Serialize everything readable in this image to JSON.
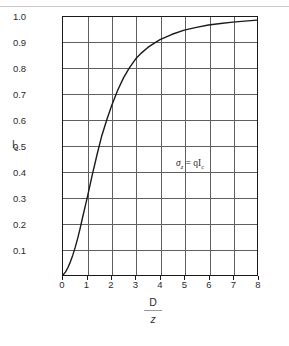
{
  "chart_data": {
    "type": "line",
    "title": "",
    "subtitle": "",
    "xlabel_numerator": "D",
    "xlabel_denominator": "z",
    "ylabel": "I",
    "ylabel_sub": "c",
    "xlim": [
      0,
      8
    ],
    "ylim": [
      0,
      1.0
    ],
    "grid": true,
    "legend_position": "none",
    "x_ticks": [
      "0",
      "1",
      "2",
      "3",
      "4",
      "5",
      "6",
      "7",
      "8"
    ],
    "y_ticks": [
      "0.1",
      "0.2",
      "0.3",
      "0.4",
      "0.5",
      "0.6",
      "0.7",
      "0.8",
      "0.9",
      "1.0"
    ],
    "annotations": [
      {
        "sigma": "σ",
        "sigma_sub": "z",
        "equals": "=",
        "rhs": "qI",
        "rhs_sub": "c",
        "full_text": "σz = qIc"
      }
    ],
    "series": [
      {
        "name": "Ic",
        "x": [
          0,
          0.1,
          0.2,
          0.3,
          0.4,
          0.5,
          0.6,
          0.7,
          0.8,
          0.9,
          1.0,
          1.2,
          1.4,
          1.6,
          1.8,
          2.0,
          2.25,
          2.5,
          2.75,
          3.0,
          3.25,
          3.5,
          3.75,
          4.0,
          4.5,
          5.0,
          5.5,
          6.0,
          6.5,
          7.0,
          7.5,
          8.0
        ],
        "values": [
          0.0,
          0.011,
          0.028,
          0.05,
          0.076,
          0.106,
          0.14,
          0.178,
          0.22,
          0.26,
          0.3,
          0.385,
          0.465,
          0.54,
          0.6,
          0.655,
          0.715,
          0.765,
          0.805,
          0.838,
          0.862,
          0.882,
          0.898,
          0.912,
          0.933,
          0.949,
          0.96,
          0.969,
          0.975,
          0.98,
          0.984,
          0.988
        ]
      }
    ]
  }
}
